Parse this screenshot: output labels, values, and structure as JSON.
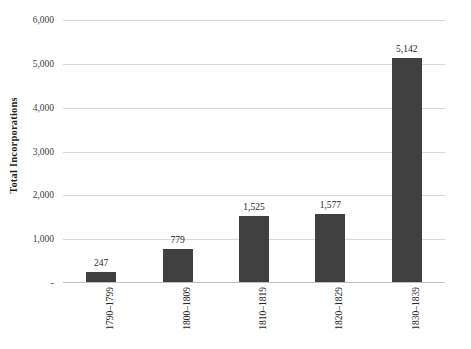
{
  "chart_data": {
    "type": "bar",
    "title": "",
    "subtitle": "",
    "xlabel": "",
    "ylabel": "Total Incorporations",
    "categories": [
      "1790–1799",
      "1800–1809",
      "1810–1819",
      "1820–1829",
      "1830–1839"
    ],
    "values": [
      247,
      779,
      1525,
      1577,
      5142
    ],
    "value_labels": [
      "247",
      "779",
      "1,525",
      "1,577",
      "5,142"
    ],
    "ylim": [
      0,
      6000
    ],
    "ytick_values": [
      0,
      1000,
      2000,
      3000,
      4000,
      5000,
      6000
    ],
    "ytick_labels": [
      "-",
      "1,000",
      "2,000",
      "3,000",
      "4,000",
      "5,000",
      "6,000"
    ],
    "grid": "horizontal",
    "legend": "none",
    "bar_color": "#404040",
    "gridline_color": "#d9d9d9",
    "axis_color": "#bfbfbf",
    "background_color": "#ffffff",
    "xtick_rotation": 90,
    "ylabel_rotation": 90
  },
  "axis": {
    "y_title": "Total Incorporations",
    "y_ticks": [
      {
        "label": "6,000",
        "value": 6000
      },
      {
        "label": "5,000",
        "value": 5000
      },
      {
        "label": "4,000",
        "value": 4000
      },
      {
        "label": "3,000",
        "value": 3000
      },
      {
        "label": "2,000",
        "value": 2000
      },
      {
        "label": "1,000",
        "value": 1000
      },
      {
        "label": "-",
        "value": 0
      }
    ]
  },
  "bars": [
    {
      "category": "1790–1799",
      "value": 247,
      "label": "247"
    },
    {
      "category": "1800–1809",
      "value": 779,
      "label": "779"
    },
    {
      "category": "1810–1819",
      "value": 1525,
      "label": "1,525"
    },
    {
      "category": "1820–1829",
      "value": 1577,
      "label": "1,577"
    },
    {
      "category": "1830–1839",
      "value": 5142,
      "label": "5,142"
    }
  ]
}
